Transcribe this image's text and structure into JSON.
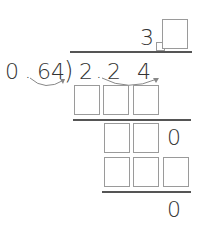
{
  "problem": {
    "divisor": "0.64",
    "divisor_parts": [
      "0",
      ".",
      "64"
    ],
    "dividend": "2.24",
    "dividend_digits": [
      "2",
      ".",
      "2",
      "4"
    ],
    "quotient_known_digit": "3",
    "row2_known_digit": "0",
    "remainder": "0"
  },
  "colors": {
    "text": "#333333",
    "box_border": "#9a9a9a",
    "line": "#555555",
    "arrow": "#888888"
  }
}
